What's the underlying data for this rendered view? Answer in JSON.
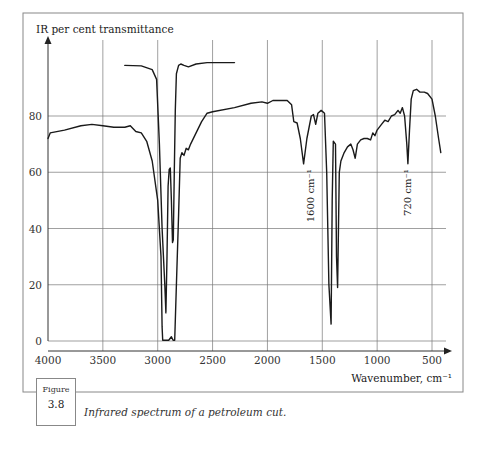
{
  "figure": {
    "label_word": "Figure",
    "number": "3.8",
    "caption": "Infrared spectrum of a petroleum cut."
  },
  "chart_data": {
    "type": "line",
    "title": "",
    "ylabel": "IR per cent transmittance",
    "xlabel": "Wavenumber, cm⁻¹",
    "x_ticks": [
      4000,
      3500,
      3000,
      2500,
      2000,
      1500,
      1000,
      500
    ],
    "y_ticks": [
      0,
      20,
      40,
      60,
      80
    ],
    "xlim": [
      4000,
      350
    ],
    "ylim": [
      0,
      95
    ],
    "x_reversed": true,
    "grid": true,
    "legend": "none",
    "annotations": [
      {
        "text": "1600 cm⁻¹",
        "x": 1600,
        "y": 60,
        "rotation": -90
      },
      {
        "text": "720 cm⁻¹",
        "x": 720,
        "y": 60,
        "rotation": -90
      }
    ],
    "series": [
      {
        "name": "Main spectrum (thin film)",
        "points": [
          [
            4000,
            72
          ],
          [
            3980,
            74
          ],
          [
            3850,
            75
          ],
          [
            3700,
            76.5
          ],
          [
            3600,
            77
          ],
          [
            3500,
            76.5
          ],
          [
            3400,
            76
          ],
          [
            3300,
            76
          ],
          [
            3250,
            76.5
          ],
          [
            3200,
            74.5
          ],
          [
            3150,
            74
          ],
          [
            3100,
            71
          ],
          [
            3050,
            64
          ],
          [
            3000,
            50
          ],
          [
            2970,
            30
          ],
          [
            2960,
            5
          ],
          [
            2955,
            0.3
          ],
          [
            2900,
            0.3
          ],
          [
            2875,
            1.5
          ],
          [
            2860,
            0.3
          ],
          [
            2845,
            0.3
          ],
          [
            2830,
            20
          ],
          [
            2810,
            45
          ],
          [
            2795,
            65
          ],
          [
            2780,
            67
          ],
          [
            2760,
            66
          ],
          [
            2740,
            68.5
          ],
          [
            2720,
            68
          ],
          [
            2700,
            70
          ],
          [
            2650,
            74
          ],
          [
            2600,
            78
          ],
          [
            2550,
            81
          ],
          [
            2500,
            81.5
          ],
          [
            2300,
            83
          ],
          [
            2150,
            84.5
          ],
          [
            2050,
            85
          ],
          [
            2000,
            84.5
          ],
          [
            1950,
            85.5
          ],
          [
            1820,
            85.5
          ],
          [
            1780,
            84
          ],
          [
            1760,
            78
          ],
          [
            1730,
            77.5
          ],
          [
            1700,
            72
          ],
          [
            1670,
            63
          ],
          [
            1640,
            72
          ],
          [
            1600,
            80
          ],
          [
            1580,
            80.5
          ],
          [
            1560,
            77
          ],
          [
            1540,
            81
          ],
          [
            1510,
            82
          ],
          [
            1480,
            81
          ],
          [
            1460,
            60
          ],
          [
            1440,
            20
          ],
          [
            1420,
            6
          ],
          [
            1410,
            50
          ],
          [
            1400,
            71
          ],
          [
            1380,
            70
          ],
          [
            1370,
            30
          ],
          [
            1360,
            19
          ],
          [
            1345,
            60
          ],
          [
            1330,
            64
          ],
          [
            1300,
            67
          ],
          [
            1270,
            69
          ],
          [
            1240,
            70
          ],
          [
            1220,
            68
          ],
          [
            1200,
            65
          ],
          [
            1180,
            70
          ],
          [
            1150,
            71.5
          ],
          [
            1120,
            72
          ],
          [
            1090,
            72
          ],
          [
            1060,
            71.5
          ],
          [
            1040,
            74
          ],
          [
            1020,
            73
          ],
          [
            1000,
            75
          ],
          [
            960,
            77
          ],
          [
            930,
            78.5
          ],
          [
            900,
            78
          ],
          [
            870,
            80
          ],
          [
            840,
            80.5
          ],
          [
            810,
            82
          ],
          [
            790,
            81
          ],
          [
            770,
            83
          ],
          [
            750,
            80
          ],
          [
            730,
            70
          ],
          [
            720,
            63
          ],
          [
            705,
            75
          ],
          [
            690,
            86
          ],
          [
            670,
            89
          ],
          [
            640,
            89.5
          ],
          [
            610,
            88.5
          ],
          [
            570,
            88.5
          ],
          [
            540,
            88
          ],
          [
            500,
            86
          ],
          [
            470,
            80
          ],
          [
            440,
            72
          ],
          [
            420,
            67
          ]
        ]
      },
      {
        "name": "C-H stretch region (diluted sample)",
        "points": [
          [
            3300,
            98
          ],
          [
            3150,
            97.8
          ],
          [
            3050,
            96.5
          ],
          [
            3010,
            93
          ],
          [
            2985,
            70
          ],
          [
            2960,
            40
          ],
          [
            2935,
            20
          ],
          [
            2925,
            10
          ],
          [
            2915,
            30
          ],
          [
            2905,
            55
          ],
          [
            2895,
            61
          ],
          [
            2885,
            61.5
          ],
          [
            2875,
            50
          ],
          [
            2865,
            35
          ],
          [
            2858,
            36
          ],
          [
            2850,
            58
          ],
          [
            2840,
            82
          ],
          [
            2830,
            95
          ],
          [
            2810,
            98
          ],
          [
            2790,
            98.5
          ],
          [
            2760,
            98
          ],
          [
            2720,
            97.5
          ],
          [
            2650,
            98.5
          ],
          [
            2550,
            99
          ],
          [
            2450,
            99
          ],
          [
            2300,
            99
          ]
        ]
      }
    ]
  }
}
